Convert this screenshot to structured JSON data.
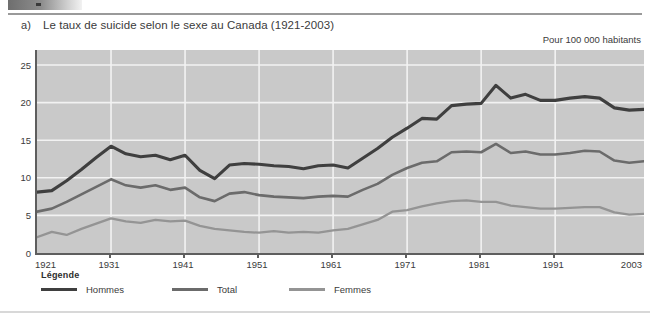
{
  "header": {
    "logo_fragment": "cropped-banner"
  },
  "figure": {
    "label": "a)",
    "title": "Le taux de suicide selon le sexe au Canada (1921-2003)",
    "units_note": "Pour 100 000 habitants"
  },
  "legend": {
    "title": "Légende",
    "items": [
      {
        "label": "Hommes",
        "color": "#3f3f3f"
      },
      {
        "label": "Total",
        "color": "#6b6b6b"
      },
      {
        "label": "Femmes",
        "color": "#949494"
      }
    ]
  },
  "axes": {
    "y_ticks": [
      "0",
      "5",
      "10",
      "15",
      "20",
      "25"
    ],
    "x_ticks": [
      "1921",
      "1931",
      "1941",
      "1951",
      "1961",
      "1971",
      "1981",
      "1991",
      "2003"
    ]
  },
  "colors": {
    "plot_background": "#c9c9c9",
    "gridline": "#f2f2f2",
    "axis": "#5e5e5e",
    "text": "#3b3b3b",
    "hommes": "#3f3f3f",
    "total": "#6b6b6b",
    "femmes": "#949494"
  },
  "chart_data": {
    "type": "line",
    "title": "Le taux de suicide selon le sexe au Canada (1921-2003)",
    "subtitle": "Pour 100 000 habitants",
    "xlabel": "",
    "ylabel": "Pour 100 000 habitants",
    "xlim": [
      1921,
      2003
    ],
    "ylim": [
      0,
      27
    ],
    "y_ticks": [
      0,
      5,
      10,
      15,
      20,
      25
    ],
    "x_ticks": [
      1921,
      1931,
      1941,
      1951,
      1961,
      1971,
      1981,
      1991,
      2003
    ],
    "grid": true,
    "legend_position": "below-left",
    "x": [
      1921,
      1923,
      1925,
      1927,
      1929,
      1931,
      1933,
      1935,
      1937,
      1939,
      1941,
      1943,
      1945,
      1947,
      1949,
      1951,
      1953,
      1955,
      1957,
      1959,
      1961,
      1963,
      1965,
      1967,
      1969,
      1971,
      1973,
      1975,
      1977,
      1979,
      1981,
      1983,
      1985,
      1987,
      1989,
      1991,
      1993,
      1995,
      1997,
      1999,
      2001,
      2003
    ],
    "series": [
      {
        "name": "Hommes",
        "color": "#3f3f3f",
        "values": [
          8.1,
          8.3,
          9.6,
          11.1,
          12.7,
          14.2,
          13.2,
          12.8,
          13.0,
          12.4,
          13.0,
          11.0,
          9.9,
          11.7,
          11.9,
          11.8,
          11.6,
          11.5,
          11.2,
          11.6,
          11.7,
          11.3,
          12.6,
          13.9,
          15.4,
          16.6,
          17.9,
          17.8,
          19.6,
          19.8,
          19.9,
          22.3,
          20.6,
          21.1,
          20.3,
          20.3,
          20.6,
          20.8,
          20.6,
          19.3,
          19.0,
          19.1
        ]
      },
      {
        "name": "Total",
        "color": "#6b6b6b",
        "values": [
          5.5,
          5.9,
          6.8,
          7.8,
          8.8,
          9.8,
          9.0,
          8.7,
          9.0,
          8.4,
          8.7,
          7.4,
          6.9,
          7.9,
          8.1,
          7.7,
          7.5,
          7.4,
          7.3,
          7.5,
          7.6,
          7.5,
          8.4,
          9.2,
          10.4,
          11.3,
          12.0,
          12.2,
          13.4,
          13.5,
          13.4,
          14.5,
          13.3,
          13.5,
          13.1,
          13.1,
          13.3,
          13.6,
          13.5,
          12.3,
          12.0,
          12.2
        ]
      },
      {
        "name": "Femmes",
        "color": "#949494",
        "values": [
          2.1,
          2.8,
          2.4,
          3.2,
          3.9,
          4.6,
          4.2,
          4.0,
          4.4,
          4.2,
          4.3,
          3.6,
          3.2,
          3.0,
          2.8,
          2.7,
          2.9,
          2.7,
          2.8,
          2.7,
          3.0,
          3.2,
          3.8,
          4.4,
          5.5,
          5.7,
          6.2,
          6.6,
          6.9,
          7.0,
          6.8,
          6.8,
          6.3,
          6.1,
          5.9,
          5.9,
          6.0,
          6.1,
          6.1,
          5.4,
          5.1,
          5.2
        ]
      }
    ]
  }
}
